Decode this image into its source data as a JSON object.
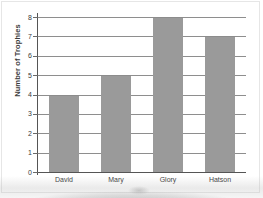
{
  "chart_data": {
    "type": "bar",
    "title": "",
    "xlabel": "",
    "ylabel": "Number of Trophies",
    "categories": [
      "David",
      "Mary",
      "Glory",
      "Hatson"
    ],
    "values": [
      4,
      5,
      8,
      7
    ],
    "ylim": [
      0,
      8
    ],
    "ytick_labels": [
      "0",
      "1",
      "2",
      "3",
      "4",
      "5",
      "6",
      "7",
      "8"
    ],
    "ytick_values": [
      0,
      1,
      2,
      3,
      4,
      5,
      6,
      7,
      8
    ],
    "grid": true,
    "grid_axis": "y",
    "legend": false,
    "bar_color": "#9a9a9a",
    "axis_color": "#555555",
    "gridline_color": "#8e8e8e",
    "background_color": "#ffffff"
  }
}
